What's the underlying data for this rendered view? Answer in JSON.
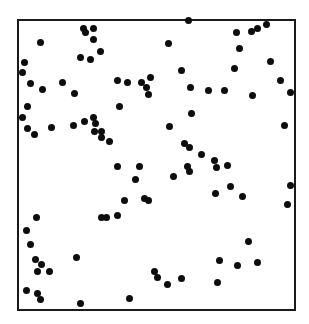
{
  "chart_data": {
    "type": "scatter",
    "title": "",
    "xlabel": "",
    "ylabel": "",
    "grid": false,
    "legend": null,
    "axes_ticks": false,
    "frame_px": {
      "left": 17,
      "top": 19,
      "right": 293,
      "bottom": 308
    },
    "marker_color": "#0d0d0d",
    "points_px": [
      [
        83,
        28
      ],
      [
        85,
        32
      ],
      [
        93,
        28
      ],
      [
        93,
        39
      ],
      [
        100,
        51
      ],
      [
        80,
        57
      ],
      [
        90,
        59
      ],
      [
        40,
        42
      ],
      [
        24,
        62
      ],
      [
        22,
        72
      ],
      [
        30,
        83
      ],
      [
        42,
        89
      ],
      [
        62,
        82
      ],
      [
        74,
        93
      ],
      [
        117,
        80
      ],
      [
        127,
        82
      ],
      [
        141,
        82
      ],
      [
        146,
        87
      ],
      [
        148,
        94
      ],
      [
        150,
        77
      ],
      [
        119,
        106
      ],
      [
        27,
        106
      ],
      [
        22,
        117
      ],
      [
        27,
        128
      ],
      [
        34,
        134
      ],
      [
        51,
        127
      ],
      [
        73,
        125
      ],
      [
        84,
        121
      ],
      [
        93,
        117
      ],
      [
        95,
        123
      ],
      [
        94,
        131
      ],
      [
        101,
        131
      ],
      [
        101,
        137
      ],
      [
        109,
        141
      ],
      [
        188,
        20
      ],
      [
        236,
        32
      ],
      [
        251,
        31
      ],
      [
        257,
        28
      ],
      [
        266,
        24
      ],
      [
        168,
        43
      ],
      [
        239,
        48
      ],
      [
        270,
        61
      ],
      [
        181,
        70
      ],
      [
        234,
        68
      ],
      [
        280,
        80
      ],
      [
        290,
        92
      ],
      [
        190,
        87
      ],
      [
        208,
        90
      ],
      [
        224,
        90
      ],
      [
        252,
        95
      ],
      [
        191,
        113
      ],
      [
        169,
        126
      ],
      [
        284,
        125
      ],
      [
        184,
        143
      ],
      [
        189,
        147
      ],
      [
        201,
        154
      ],
      [
        214,
        160
      ],
      [
        117,
        166
      ],
      [
        139,
        166
      ],
      [
        135,
        179
      ],
      [
        124,
        200
      ],
      [
        106,
        217
      ],
      [
        187,
        166
      ],
      [
        189,
        171
      ],
      [
        173,
        176
      ],
      [
        216,
        167
      ],
      [
        227,
        165
      ],
      [
        215,
        193
      ],
      [
        230,
        186
      ],
      [
        242,
        196
      ],
      [
        290,
        185
      ],
      [
        287,
        204
      ],
      [
        248,
        241
      ],
      [
        257,
        262
      ],
      [
        219,
        260
      ],
      [
        237,
        265
      ],
      [
        217,
        282
      ],
      [
        36,
        217
      ],
      [
        26,
        230
      ],
      [
        30,
        244
      ],
      [
        35,
        259
      ],
      [
        41,
        264
      ],
      [
        37,
        271
      ],
      [
        49,
        271
      ],
      [
        76,
        257
      ],
      [
        26,
        290
      ],
      [
        37,
        293
      ],
      [
        40,
        299
      ],
      [
        80,
        303
      ],
      [
        129,
        298
      ],
      [
        154,
        271
      ],
      [
        157,
        277
      ],
      [
        167,
        284
      ],
      [
        181,
        278
      ],
      [
        101,
        217
      ],
      [
        117,
        215
      ],
      [
        144,
        198
      ],
      [
        148,
        200
      ]
    ]
  }
}
